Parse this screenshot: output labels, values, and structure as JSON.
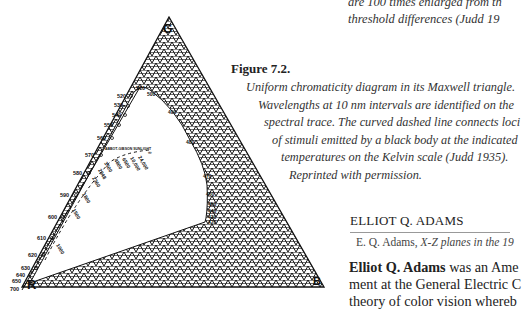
{
  "top_caption": {
    "line1": "are 100 times enlarged from th",
    "line2": "threshold differences (Judd 19"
  },
  "figure": {
    "title": "Figure 7.2.",
    "caption_lines": [
      "Uniform chromaticity diagram in its Maxwell triangle.",
      "Wavelengths at 10 nm intervals are identified on the",
      "spectral trace. The curved dashed line connects loci",
      "of stimuli emitted by a black body at the indicated",
      "temperatures on the Kelvin scale (Judd 1935).",
      "Reprinted with permission."
    ],
    "vertex_labels": {
      "green": "G",
      "red": "R",
      "blue": "B"
    },
    "wavelength_labels": [
      "510",
      "520",
      "530",
      "540",
      "550",
      "560",
      "570",
      "580",
      "590",
      "600",
      "610",
      "620",
      "630",
      "640",
      "650",
      "700"
    ],
    "inner_labels": [
      "500",
      "490",
      "480",
      "470",
      "460",
      "450",
      "440",
      "430",
      "420",
      "400"
    ],
    "temperature_labels": [
      "1000",
      "1500",
      "1800",
      "2360",
      "2848",
      "3500",
      "4800",
      "6500",
      "10,000",
      "24,000",
      "∞"
    ],
    "annotation": "ABBOT-GIBSON SUNLIGHT"
  },
  "section": {
    "heading": "ELLIOT Q. ADAMS",
    "subtitle_author": "E. Q. Adams, ",
    "subtitle_title": "X-Z planes in the 19",
    "body_name": "Elliot Q. Adams",
    "body_line1_rest": " was an Ame",
    "body_line2": "ment at the General Electric C",
    "body_line3": "theory of color vision whereb"
  }
}
